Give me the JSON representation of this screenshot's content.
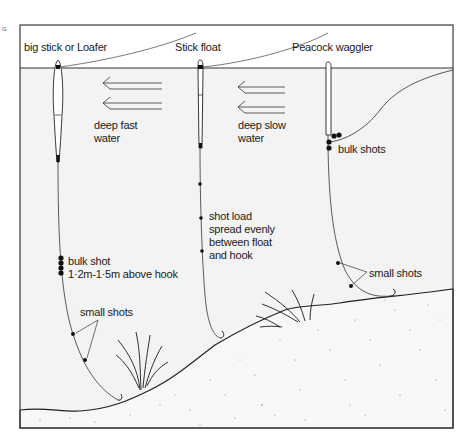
{
  "diagram": {
    "side_mark": "G",
    "floats": [
      {
        "id": "loafer",
        "label": "big stick or Loafer"
      },
      {
        "id": "stick",
        "label": "Stick float"
      },
      {
        "id": "waggler",
        "label": "Peacock waggler"
      }
    ],
    "water_labels": [
      {
        "id": "fast",
        "line1": "deep fast",
        "line2": "water"
      },
      {
        "id": "slow",
        "line1": "deep slow",
        "line2": "water"
      }
    ],
    "annotations": {
      "bulk_shot_line1": "bulk shot",
      "bulk_shot_line2": "1·2m-1·5m above hook",
      "small_shots_left": "small shots",
      "shot_load": [
        "shot load",
        "spread evenly",
        "between float",
        "and hook"
      ],
      "bulk_shots_right": "bulk shots",
      "small_shots_right": "small shots"
    },
    "colors": {
      "frame": "#3a3a3a",
      "water": "#f3f3f3",
      "bed": "#f6f6f6",
      "ink": "#1a1a1a"
    }
  }
}
